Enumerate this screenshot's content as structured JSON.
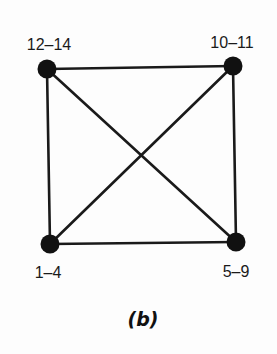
{
  "diagram": {
    "type": "complete-graph-K4",
    "caption": "(b)",
    "colors": {
      "background": "#fdfdfd",
      "edge": "#1a1a1a",
      "node": "#111111",
      "text": "#1a1a1a"
    },
    "nodes": [
      {
        "id": "tl",
        "label": "12–14",
        "x": 47,
        "y": 69
      },
      {
        "id": "tr",
        "label": "10–11",
        "x": 233,
        "y": 66
      },
      {
        "id": "bl",
        "label": "1–4",
        "x": 50,
        "y": 244
      },
      {
        "id": "br",
        "label": "5–9",
        "x": 236,
        "y": 242
      }
    ],
    "edges": [
      {
        "from": "tl",
        "to": "tr"
      },
      {
        "from": "tl",
        "to": "bl"
      },
      {
        "from": "tr",
        "to": "br"
      },
      {
        "from": "bl",
        "to": "br"
      },
      {
        "from": "tl",
        "to": "br"
      },
      {
        "from": "tr",
        "to": "bl"
      }
    ]
  }
}
